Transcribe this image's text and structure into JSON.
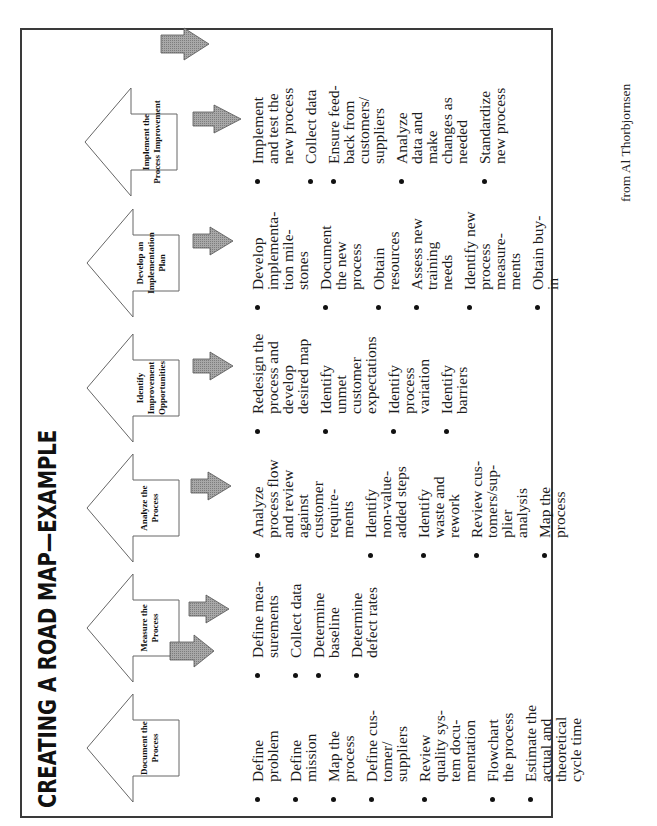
{
  "title": "CREATING A ROAD MAP—EXAMPLE",
  "caption": "from Al Thorbjornsen",
  "colors": {
    "frame": "#3a3a3a",
    "gray_arrow_fill": "#9a9a9a",
    "gray_arrow_stroke": "#555555",
    "big_arrow_stroke": "#666666",
    "text": "#1c1c1c"
  },
  "steps": [
    {
      "label": "Document the\nProcess",
      "items": [
        "Define\nproblem",
        "Define\nmission",
        "Map the\nprocess",
        "Define cus-\ntomer/\nsuppliers",
        "Review\nquality sys-\ntem docu-\nmentation",
        "Flowchart\nthe process",
        "Estimate the\nactual and\ntheoretical\ncycle time"
      ]
    },
    {
      "label": "Measure the\nProcess",
      "items": [
        "Define mea-\nsurements",
        "Collect data",
        "Determine\nbaseline",
        "Determine\ndefect rates"
      ]
    },
    {
      "label": "Analyze the\nProcess",
      "items": [
        "Analyze\nprocess flow\nand review\nagainst\ncustomer\nrequire-\nments",
        "Identify\nnon-value-\nadded steps",
        "Identify\nwaste and\nrework",
        "Review cus-\ntomers/sup-\nplier\nanalysis",
        "Map the\nprocess"
      ]
    },
    {
      "label": "Identify\nImprovement\nOpportunities",
      "items": [
        "Redesign the\nprocess and\ndevelop\ndesired map",
        "Identify\nunmet\ncustomer\nexpectations",
        "Identify\nprocess\nvariation",
        "Identify\nbarriers"
      ]
    },
    {
      "label": "Develop an\nImplementation\nPlan",
      "items": [
        "Develop\nimplementa-\ntion mile-\nstones",
        "Document\nthe new\nprocess",
        "Obtain\nresources",
        "Assess new\ntraining\nneeds",
        "Identify new\nprocess\nmeasure-\nments",
        "Obtain buy-\nin"
      ]
    },
    {
      "label": "Implement the\nProcess Improvement",
      "items": [
        "Implement\nand test the\nnew process",
        "Collect data",
        "Ensure feed-\nback from\ncustomers/\nsuppliers",
        "Analyze\ndata and\nmake\nchanges as\nneeded",
        "Standardize\nnew process"
      ]
    }
  ],
  "flow_arrows": [
    {
      "direction": "left",
      "position": "before Measure the Process"
    },
    {
      "direction": "down",
      "position": "under Measure the Process"
    },
    {
      "direction": "down",
      "position": "under Analyze the Process"
    },
    {
      "direction": "down",
      "position": "under Identify Improvement Opportunities"
    },
    {
      "direction": "down",
      "position": "under Develop an Implementation Plan"
    },
    {
      "direction": "down",
      "position": "under Implement the Process Improvement"
    },
    {
      "direction": "right",
      "position": "after Implement the Process Improvement"
    }
  ]
}
